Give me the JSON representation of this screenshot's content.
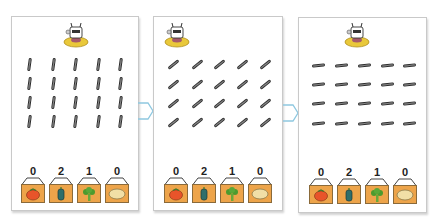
{
  "colors": {
    "panel_border": "#c9c9c9",
    "arrow": "#8ec8e0",
    "bin_fill": "#eda44a",
    "bin_border": "#8a6a3a",
    "stick": "#555555",
    "tomato": "#e8542a",
    "pepper": "#2f6e6a",
    "broccoli": "#4d9a2e",
    "potato": "#f1dfa6"
  },
  "panels": [
    {
      "stick_orientation": "vertical",
      "stick_rows": 4,
      "stick_cols": 5,
      "bins": [
        {
          "vegetable": "tomato",
          "count": "0"
        },
        {
          "vegetable": "pepper",
          "count": "2"
        },
        {
          "vegetable": "broccoli",
          "count": "1"
        },
        {
          "vegetable": "potato",
          "count": "0"
        }
      ]
    },
    {
      "stick_orientation": "diagonal",
      "stick_rows": 4,
      "stick_cols": 5,
      "bins": [
        {
          "vegetable": "tomato",
          "count": "0"
        },
        {
          "vegetable": "pepper",
          "count": "2"
        },
        {
          "vegetable": "broccoli",
          "count": "1"
        },
        {
          "vegetable": "potato",
          "count": "0"
        }
      ]
    },
    {
      "stick_orientation": "horizontal",
      "stick_rows": 4,
      "stick_cols": 5,
      "bins": [
        {
          "vegetable": "tomato",
          "count": "0"
        },
        {
          "vegetable": "pepper",
          "count": "2"
        },
        {
          "vegetable": "broccoli",
          "count": "1"
        },
        {
          "vegetable": "potato",
          "count": "0"
        }
      ]
    }
  ],
  "arrows": [
    {
      "icon": "arrow-right-icon"
    },
    {
      "icon": "arrow-right-icon"
    }
  ]
}
